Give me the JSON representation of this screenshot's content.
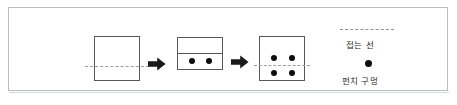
{
  "diagram": {
    "colors": {
      "frame_border": "#b9bcbe",
      "paper_outline": "#56585a",
      "fold_line": "#9a9ea1",
      "hole_fill": "#0d0d0d",
      "arrow_fill": "#1a1a1a",
      "background": "#ffffff",
      "text": "#2b2b2b"
    },
    "stages": [
      {
        "id": "stage-1-flat-sheet",
        "shape": "square",
        "fold_line": "horizontal-dashed",
        "holes": 0
      },
      {
        "id": "stage-2-folded-sheet",
        "shape": "rectangle",
        "fold_line": "horizontal-solid-edge",
        "holes": 2,
        "hole_positions": [
          "lower-left",
          "lower-right"
        ]
      },
      {
        "id": "stage-3-unfolded-sheet",
        "shape": "square",
        "fold_line": "horizontal-dashed",
        "holes": 4,
        "hole_positions": [
          "upper-left",
          "upper-right",
          "lower-left",
          "lower-right"
        ]
      }
    ],
    "arrows": [
      {
        "id": "arrow-1",
        "direction": "right"
      },
      {
        "id": "arrow-2",
        "direction": "right"
      }
    ]
  },
  "legend": {
    "fold_line_label": "접는 선",
    "punch_hole_label": "펀치 구멍",
    "fold_line_sample": "dashed-line-icon",
    "punch_hole_sample": "filled-circle-icon"
  }
}
